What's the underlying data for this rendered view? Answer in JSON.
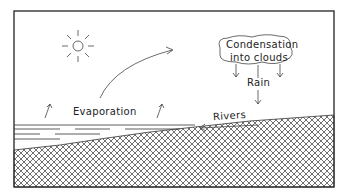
{
  "diagram": {
    "labels": {
      "condensation_line1": "Condensation",
      "condensation_line2": "into clouds",
      "rain": "Rain",
      "evaporation": "Evaporation",
      "rivers": "Rivers"
    },
    "colors": {
      "ink": "#222222",
      "background": "#ffffff"
    }
  }
}
